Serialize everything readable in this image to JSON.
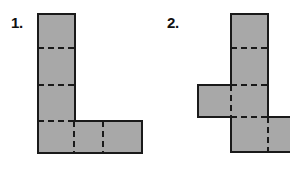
{
  "page": {
    "background_color": "#ffffff",
    "width": 290,
    "height": 190
  },
  "style": {
    "fill_color": "#a8a8a8",
    "outline_color": "#1a1a1a",
    "fold_line_color": "#1a1a1a",
    "outline_width": 2,
    "fold_line_width": 2,
    "fold_dash_pattern": "6 4"
  },
  "figures": [
    {
      "label": "1.",
      "name": "figure-1",
      "shape": "L-shaped net",
      "unit_square_size": 36,
      "square_count": 6,
      "outline_points": "38,14 75,14 75,121 142,121 142,153 38,153",
      "fold_lines": [
        {
          "name": "fold-h-1",
          "points": "38,48 75,48"
        },
        {
          "name": "fold-h-2",
          "points": "38,85 75,85"
        },
        {
          "name": "fold-h-3",
          "points": "38,121 75,121"
        },
        {
          "name": "fold-v-1",
          "points": "74,121 74,153"
        },
        {
          "name": "fold-v-2",
          "points": "103,121 103,153"
        }
      ]
    },
    {
      "label": "2.",
      "name": "figure-2",
      "shape": "cross-shaped net",
      "unit_square_size": 36,
      "square_count": 6,
      "outline_points": "231,14 268,14 268,117 292,117 292,152 231,152 231,117 198,117 198,85 231,85",
      "fold_lines": [
        {
          "name": "fold-h-1",
          "points": "231,48 268,48"
        },
        {
          "name": "fold-h-2",
          "points": "231,85 268,85"
        },
        {
          "name": "fold-h-3",
          "points": "231,117 268,117"
        },
        {
          "name": "fold-v-1",
          "points": "231,85 231,117"
        },
        {
          "name": "fold-v-2",
          "points": "268,117 268,152"
        }
      ]
    }
  ]
}
